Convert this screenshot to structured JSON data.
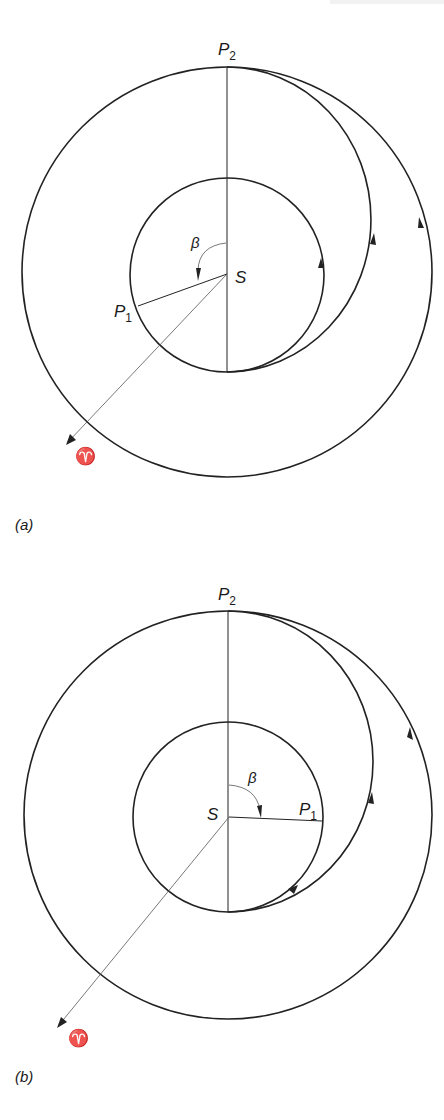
{
  "header_fragment": "p",
  "figures": [
    {
      "id": "a",
      "caption": "(a)",
      "labels": {
        "departure_point": "P",
        "departure_sub": "1",
        "arrival_point": "P",
        "arrival_sub": "2",
        "sun": "S",
        "angle": "β",
        "vernal_equinox": "♈"
      },
      "geometry": {
        "sun": [
          227,
          274
        ],
        "inner_orbit_radius": 97,
        "outer_orbit_radius": 205,
        "outer_center": [
          227,
          272
        ],
        "transfer_orbit": "Hohmann half-ellipse from inner perihelion (bottom) to outer aphelion P2 (top), counter-clockwise",
        "P1_position": "inner orbit, left side (beta > 180° measured from S–P2 line)"
      }
    },
    {
      "id": "b",
      "caption": "(b)",
      "labels": {
        "departure_point": "P",
        "departure_sub": "1",
        "arrival_point": "P",
        "arrival_sub": "2",
        "sun": "S",
        "angle": "β",
        "vernal_equinox": "♈"
      },
      "geometry": {
        "sun": [
          229,
          817
        ],
        "inner_orbit_radius": 95,
        "outer_orbit_radius": 204,
        "outer_center": [
          228,
          815
        ],
        "transfer_orbit": "Hohmann half-ellipse from inner perihelion (bottom) to outer aphelion P2 (top), counter-clockwise",
        "P1_position": "inner orbit, right side (beta ≈ 90° measured from S–P2 line)"
      }
    }
  ]
}
